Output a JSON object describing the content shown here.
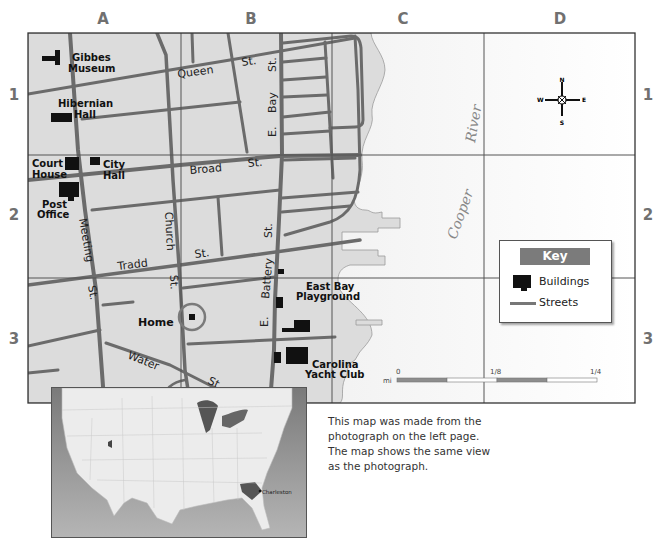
{
  "grid": {
    "columns": [
      "A",
      "B",
      "C",
      "D"
    ],
    "rows": [
      "1",
      "2",
      "3"
    ]
  },
  "buildings": {
    "gibbes": [
      "Gibbes",
      "Museum"
    ],
    "hibernian": [
      "Hibernian",
      "Hall"
    ],
    "court_house": [
      "Court",
      "House"
    ],
    "city_hall": [
      "City",
      "Hall"
    ],
    "post_office": [
      "Post",
      "Office"
    ],
    "home": "Home",
    "east_bay_playground": [
      "East Bay",
      "Playground"
    ],
    "carolina_yacht_club": [
      "Carolina",
      "Yacht Club"
    ]
  },
  "streets": {
    "queen": "Queen",
    "queen_st": "St.",
    "broad": "Broad",
    "broad_st": "St.",
    "tradd": "Tradd",
    "tradd_st": "St.",
    "meeting": "Meeting",
    "meeting_st": "St.",
    "church": "Church",
    "church_st": "St.",
    "water": "Water",
    "water_st": "St.",
    "east_bay_e": "E.",
    "east_bay": "Bay",
    "east_bay_st": "St.",
    "battery_e": "E.",
    "battery": "Battery",
    "battery_st": "St."
  },
  "water": {
    "river_word1": "Cooper",
    "river_word2": "River"
  },
  "compass": {
    "n": "N",
    "s": "S",
    "e": "E",
    "w": "W"
  },
  "key": {
    "title": "Key",
    "items": [
      {
        "label": "Buildings",
        "symbol": "black-building-shape"
      },
      {
        "label": "Streets",
        "symbol": "gray-line"
      }
    ]
  },
  "scale": {
    "unit": "mi",
    "ticks": [
      "0",
      "1/8",
      "1/4"
    ]
  },
  "inset": {
    "city_label": "Charleston"
  },
  "caption": {
    "lines": [
      "This map was made from the",
      "photograph on the left page.",
      "The map shows the same view",
      "as the photograph."
    ]
  },
  "colors": {
    "land": "#dcdcdc",
    "water": "#f4f4f4",
    "street": "#6b6b6b",
    "building": "#111111",
    "grid_label": "#707070",
    "key_header": "#7b7b7b"
  }
}
